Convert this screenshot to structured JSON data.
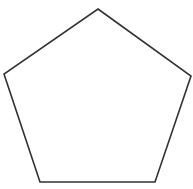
{
  "diagram": {
    "shape": "pentagon",
    "background": "#ffffff",
    "stroke_color": "#333333",
    "stroke_width": 1.6,
    "fill": "none",
    "vertices": [
      {
        "name": "top",
        "x": 98,
        "y": 9
      },
      {
        "name": "right",
        "x": 191,
        "y": 76
      },
      {
        "name": "bottom-right",
        "x": 155,
        "y": 182
      },
      {
        "name": "bottom-left",
        "x": 40,
        "y": 182
      },
      {
        "name": "left",
        "x": 4,
        "y": 74
      }
    ]
  }
}
